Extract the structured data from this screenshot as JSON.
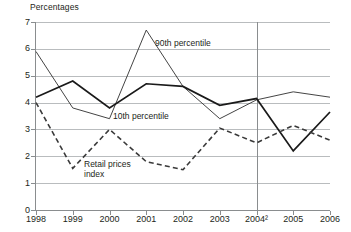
{
  "chart_data": {
    "type": "line",
    "title": "Percentages",
    "xlabel": "",
    "ylabel": "",
    "ylim": [
      0,
      7
    ],
    "xlim": [
      1998,
      2006
    ],
    "grid": true,
    "legend_position": "inline-annotations",
    "categories": [
      "1998",
      "1999",
      "2000",
      "2001",
      "2002",
      "2003",
      "2004",
      "2005",
      "2006"
    ],
    "category_labels": [
      "1998",
      "1999",
      "2000",
      "2001",
      "2002",
      "2003",
      "2004²",
      "2005",
      "2006"
    ],
    "ytick_labels": [
      "0",
      "1",
      "2",
      "3",
      "4",
      "5",
      "6",
      "7"
    ],
    "ytick_values": [
      0,
      1,
      2,
      3,
      4,
      5,
      6,
      7
    ],
    "series": [
      {
        "name": "90th percentile",
        "style": "solid-thin",
        "color": "#3a3a3a",
        "values": [
          5.9,
          3.8,
          3.4,
          6.7,
          4.6,
          3.4,
          4.1,
          4.4,
          4.2
        ]
      },
      {
        "name": "10th percentile",
        "style": "solid-thick",
        "color": "#1a1a1a",
        "values": [
          4.2,
          4.8,
          3.8,
          4.7,
          4.6,
          3.9,
          4.15,
          2.2,
          3.65
        ]
      },
      {
        "name": "Retail prices index",
        "style": "dashed",
        "color": "#3a3a3a",
        "values": [
          4.0,
          1.55,
          3.0,
          1.8,
          1.5,
          3.05,
          2.5,
          3.15,
          2.6
        ]
      }
    ],
    "annotations": [
      {
        "text": "90th percentile",
        "series": "90th percentile"
      },
      {
        "text": "10th percentile",
        "series": "10th percentile"
      },
      {
        "text": "Retail prices index",
        "series": "Retail prices index"
      }
    ],
    "footnote_marker": "2",
    "footnote_on_category": "2004"
  },
  "colors": {
    "grid": "#b9bcbe",
    "axis": "#8a8d8f",
    "text": "#231f20",
    "background": "#ffffff"
  }
}
